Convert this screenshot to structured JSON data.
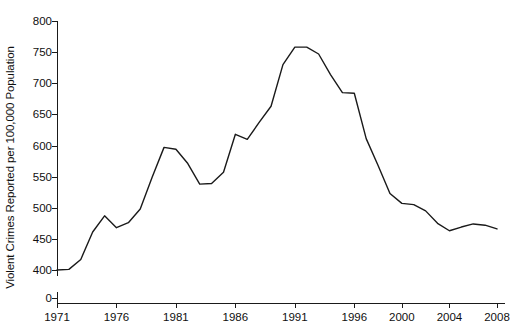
{
  "chart_data": {
    "type": "line",
    "title": "",
    "xlabel": "",
    "ylabel": "Violent Crimes Reported per 100,000 Population",
    "xlim": [
      1971,
      2008
    ],
    "ylim": [
      0,
      800
    ],
    "y_axis_break": true,
    "y_break_between": [
      0,
      400
    ],
    "grid": false,
    "legend": null,
    "x_tick_labels": [
      "1971",
      "1976",
      "1981",
      "1986",
      "1991",
      "1996",
      "2000",
      "2004",
      "2008"
    ],
    "x_tick_values": [
      1971,
      1976,
      1981,
      1986,
      1991,
      1996,
      2000,
      2004,
      2008
    ],
    "y_tick_labels": [
      "0",
      "400",
      "450",
      "500",
      "550",
      "600",
      "650",
      "700",
      "750",
      "800"
    ],
    "y_tick_values": [
      0,
      400,
      450,
      500,
      550,
      600,
      650,
      700,
      750,
      800
    ],
    "line_color": "#1a1a1a",
    "line_width": 1.4,
    "x": [
      1971,
      1972,
      1973,
      1974,
      1975,
      1976,
      1977,
      1978,
      1979,
      1980,
      1981,
      1982,
      1983,
      1984,
      1985,
      1986,
      1987,
      1988,
      1989,
      1990,
      1991,
      1992,
      1993,
      1994,
      1995,
      1996,
      1997,
      1998,
      1999,
      2000,
      2001,
      2002,
      2003,
      2004,
      2005,
      2006,
      2007,
      2008
    ],
    "values": [
      400,
      401,
      417,
      461,
      487,
      468,
      476,
      498,
      549,
      597,
      594,
      571,
      538,
      539,
      557,
      618,
      610,
      637,
      663,
      730,
      758,
      758,
      747,
      714,
      685,
      684,
      611,
      568,
      523,
      507,
      505,
      495,
      475,
      463,
      469,
      474,
      472,
      466
    ],
    "series": [
      {
        "name": "Violent crime rate",
        "values": [
          400,
          401,
          417,
          461,
          487,
          468,
          476,
          498,
          549,
          597,
          594,
          571,
          538,
          539,
          557,
          618,
          610,
          637,
          663,
          730,
          758,
          758,
          747,
          714,
          685,
          684,
          611,
          568,
          523,
          507,
          505,
          495,
          475,
          463,
          469,
          474,
          472,
          466
        ]
      }
    ],
    "annotations": []
  }
}
